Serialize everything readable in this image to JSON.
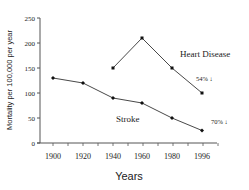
{
  "chart_data": {
    "type": "line",
    "title": "",
    "xlabel": "Years",
    "ylabel": "Mortality per 100,000 per year",
    "x": [
      1900,
      1920,
      1940,
      1960,
      1980,
      1996
    ],
    "x_tick_labels": [
      "1900",
      "1920",
      "1940",
      "1960",
      "1980",
      "1996"
    ],
    "y_tick_labels": [
      "0",
      "50",
      "100",
      "150",
      "200",
      "250"
    ],
    "ylim": [
      0,
      250
    ],
    "grid": false,
    "legend": "none (inline labels)",
    "series": [
      {
        "name": "Heart Disease",
        "x": [
          1940,
          1960,
          1980,
          1996
        ],
        "values": [
          150,
          210,
          150,
          100
        ],
        "marker": "square",
        "annotation": "54% ↓"
      },
      {
        "name": "Stroke",
        "x": [
          1900,
          1920,
          1940,
          1960,
          1980,
          1996
        ],
        "values": [
          130,
          120,
          90,
          80,
          50,
          25
        ],
        "marker": "diamond",
        "annotation": "70% ↓"
      }
    ]
  },
  "labels": {
    "heart": "Heart Disease",
    "stroke": "Stroke",
    "heart_pct": "54% ↓",
    "stroke_pct": "70% ↓",
    "xlabel": "Years",
    "ylabel": "Mortality per 100,000 per year"
  },
  "colors": {
    "line": "#333333",
    "axis": "#555555"
  }
}
